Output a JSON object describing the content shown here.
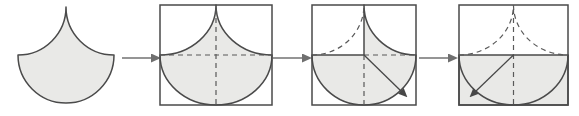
{
  "colors": {
    "background": "#ffffff",
    "shape_fill": "#e9e9e7",
    "outline": "#4a4a4a",
    "dashed": "#595959",
    "step_arrow_shaft": "#959595",
    "step_arrow_head": "#6f6f6f",
    "motion_arrow": "#474747"
  },
  "panels": {
    "original": {
      "shape_path": "M 18 55 A 48 48 0 0 0 66 7 A 48 48 0 0 0 114 55 A 48 48 0 0 1 18 55 Z"
    },
    "step1": {
      "square": {
        "x": 160,
        "y": 5,
        "w": 112,
        "h": 100
      },
      "shape_path": "M 160 55 A 56 50 0 0 0 216 5 A 56 50 0 0 0 272 55 A 56 50 0 0 1 160 55 Z",
      "dashed_horizontal": "M 160 55 H 272",
      "dashed_vertical": "M 216 9 V 105"
    },
    "step2": {
      "square": {
        "x": 312,
        "y": 5,
        "w": 104,
        "h": 100
      },
      "filled_region": "M 364 5 A 52 50 0 0 0 416 55 A 52 50 0 0 1 312 55 L 364 55 Z",
      "dashed_left_arc": "M 312 55 A 52 50 0 0 0 364 5",
      "dashed_horizontal": "M 364 55 H 416",
      "dashed_vertical": "M 364 55 V 105",
      "motion_arrow": "M 364 55 L 402 92"
    },
    "step3": {
      "square": {
        "x": 459,
        "y": 5,
        "w": 109,
        "h": 100
      },
      "filled_rect": {
        "x": 459,
        "y": 55,
        "w": 109,
        "h": 50
      },
      "semicircle": "M 459 55 A 54.5 50 0 0 0 568 55",
      "dashed_left_arc": "M 459 55 A 54.5 50 0 0 0 513.5 5",
      "dashed_right_arc": "M 513.5 5 A 54.5 50 0 0 0 568 55",
      "dashed_vertical": "M 513.5 9 V 105",
      "motion_arrow": "M 513.5 55 L 475 92"
    }
  },
  "step_arrows": [
    {
      "path": "M 122 58 H 152"
    },
    {
      "path": "M 273 58 H 303"
    },
    {
      "path": "M 419 58 H 449"
    }
  ]
}
